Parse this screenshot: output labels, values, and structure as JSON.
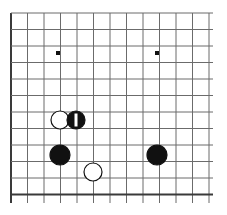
{
  "diagram": {
    "kind": "go-board-diagram",
    "board": {
      "columns": 13,
      "rows": 12,
      "left_px": 11,
      "top_px": 13,
      "right_px": 213,
      "bottom_px": 203,
      "spacing_px": 16.5,
      "line_color": "#6b6b6b",
      "edge_color": "#3a3a3a",
      "background_color": "#ffffff",
      "line_width": 1,
      "edge_width": 2
    },
    "star_points": [
      {
        "name": "star-point-left",
        "col": 3,
        "row": 2,
        "x": 58,
        "y": 53,
        "size": 4,
        "color": "#111111"
      },
      {
        "name": "star-point-right",
        "col": 9,
        "row": 2,
        "x": 157,
        "y": 53,
        "size": 4,
        "color": "#111111"
      }
    ],
    "stones": [
      {
        "name": "white-stone-upper",
        "color": "white",
        "col": 3,
        "row": 6,
        "x": 60,
        "y": 120,
        "radius": 9,
        "fill": "#ffffff",
        "stroke": "#111111",
        "marker": null
      },
      {
        "name": "black-stone-move-1",
        "color": "black",
        "col": 4,
        "row": 6,
        "x": 76,
        "y": 120,
        "radius": 9,
        "fill": "#111111",
        "stroke": "#111111",
        "marker": {
          "type": "bar",
          "label": "1",
          "color": "#ffffff",
          "width": 3,
          "height": 13
        }
      },
      {
        "name": "black-stone-lower-left",
        "color": "black",
        "col": 3,
        "row": 8,
        "x": 60,
        "y": 155,
        "radius": 10,
        "fill": "#111111",
        "stroke": "#111111",
        "marker": null
      },
      {
        "name": "white-stone-lower",
        "color": "white",
        "col": 5,
        "row": 9,
        "x": 93,
        "y": 172,
        "radius": 9,
        "fill": "#ffffff",
        "stroke": "#111111",
        "marker": null
      },
      {
        "name": "black-stone-right",
        "color": "black",
        "col": 9,
        "row": 8,
        "x": 157,
        "y": 155,
        "radius": 10,
        "fill": "#111111",
        "stroke": "#111111",
        "marker": null
      }
    ]
  }
}
